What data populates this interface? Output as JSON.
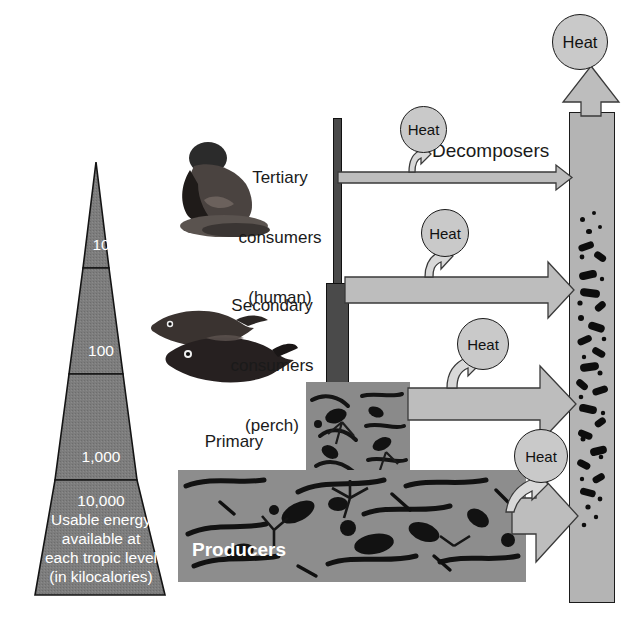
{
  "diagram": {
    "colors": {
      "pyramid_fill": "#7d7d7d",
      "pyramid_apex_fill": "#8f8f8f",
      "arrow_fill": "#bdbdbd",
      "heat_fill": "#c9c9c9",
      "bar_fill": "#4a4a4a",
      "decomposer_fill": "#b4b4b4",
      "panel_fill": "#8d8d8d",
      "outline": "#1b1b1b",
      "text_dark": "#1a1a1a",
      "text_light": "#ffffff"
    }
  },
  "pyramid": {
    "name": "energy-pyramid",
    "unit_note": "kilocalories",
    "tiers": [
      {
        "id": "tier-tertiary",
        "value": "10",
        "lines": [
          "10"
        ]
      },
      {
        "id": "tier-secondary",
        "value": "100",
        "lines": [
          "100"
        ]
      },
      {
        "id": "tier-primary",
        "value": "1,000",
        "lines": [
          "1,000"
        ]
      },
      {
        "id": "tier-producers",
        "value": "10,000",
        "lines": [
          "10,000",
          "Usable energy",
          "available at",
          "each tropic level",
          "(in kilocalories)"
        ]
      }
    ],
    "base_caption_line1": "10,000",
    "base_caption_line2": "Usable energy",
    "base_caption_line3": "available at",
    "base_caption_line4": "each tropic level",
    "base_caption_line5": "(in kilocalories)"
  },
  "trophic_labels": {
    "tertiary": {
      "line1": "Tertiary",
      "line2": "consumers",
      "line3": "(human)"
    },
    "secondary": {
      "line1": "Secondary",
      "line2": "consumers",
      "line3": "(perch)"
    },
    "primary": {
      "line1": "Primary",
      "line2": "consumers",
      "line3": "(zooplankton)"
    }
  },
  "producers": {
    "line1": "Producers",
    "line2": "(phytoplankton)"
  },
  "decomposers": {
    "label": "Decomposers"
  },
  "heat": {
    "label": "Heat",
    "bubbles": [
      {
        "id": "heat-top",
        "label": "Heat"
      },
      {
        "id": "heat-tertiary",
        "label": "Heat"
      },
      {
        "id": "heat-secondary",
        "label": "Heat"
      },
      {
        "id": "heat-primary",
        "label": "Heat"
      },
      {
        "id": "heat-producers",
        "label": "Heat"
      }
    ]
  }
}
